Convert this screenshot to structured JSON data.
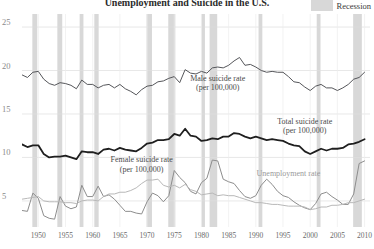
{
  "chart_data": {
    "type": "line",
    "title": "Unemployment and Suicide in the U.S.",
    "xlabel": "",
    "ylabel": "",
    "xlim": [
      1947,
      2011
    ],
    "ylim": [
      2.0,
      26.5
    ],
    "grid": true,
    "x_ticks": [
      "1950",
      "1955",
      "1960",
      "1965",
      "1970",
      "1975",
      "1980",
      "1985",
      "1990",
      "1995",
      "2000",
      "2005",
      "2010"
    ],
    "x_tick_values": [
      1950,
      1955,
      1960,
      1965,
      1970,
      1975,
      1980,
      1985,
      1990,
      1995,
      2000,
      2005,
      2010
    ],
    "y_ticks": [
      "25",
      "20",
      "15",
      "10",
      "5"
    ],
    "y_tick_values": [
      25,
      20,
      15,
      10,
      5
    ],
    "legend_position": "top-right",
    "legend": [
      {
        "label": "Recession",
        "color": "#d8d8d8",
        "kind": "band"
      }
    ],
    "recessions": [
      {
        "start": 1948.9,
        "end": 1949.8
      },
      {
        "start": 1953.5,
        "end": 1954.4
      },
      {
        "start": 1957.6,
        "end": 1958.3
      },
      {
        "start": 1960.3,
        "end": 1961.1
      },
      {
        "start": 1969.9,
        "end": 1970.9
      },
      {
        "start": 1973.9,
        "end": 1975.2
      },
      {
        "start": 1980.0,
        "end": 1980.5
      },
      {
        "start": 1981.5,
        "end": 1982.9
      },
      {
        "start": 1990.5,
        "end": 1991.2
      },
      {
        "start": 2001.2,
        "end": 2001.9
      },
      {
        "start": 2007.9,
        "end": 2009.5
      }
    ],
    "x": [
      1947,
      1948,
      1949,
      1950,
      1951,
      1952,
      1953,
      1954,
      1955,
      1956,
      1957,
      1958,
      1959,
      1960,
      1961,
      1962,
      1963,
      1964,
      1965,
      1966,
      1967,
      1968,
      1969,
      1970,
      1971,
      1972,
      1973,
      1974,
      1975,
      1976,
      1977,
      1978,
      1979,
      1980,
      1981,
      1982,
      1983,
      1984,
      1985,
      1986,
      1987,
      1988,
      1989,
      1990,
      1991,
      1992,
      1993,
      1994,
      1995,
      1996,
      1997,
      1998,
      1999,
      2000,
      2001,
      2002,
      2003,
      2004,
      2005,
      2006,
      2007,
      2008,
      2009,
      2010
    ],
    "series": [
      {
        "name": "Male suicide rate (per 100,000)",
        "color": "#55565a",
        "width": 1.0,
        "label_x": 1983,
        "label_y": 18.6,
        "values": [
          19.5,
          19.2,
          19.8,
          19.9,
          19.0,
          18.5,
          18.3,
          18.6,
          18.5,
          18.3,
          17.9,
          18.9,
          18.4,
          18.4,
          18.0,
          18.3,
          18.4,
          18.0,
          18.4,
          17.9,
          17.6,
          17.2,
          17.8,
          18.2,
          18.3,
          18.7,
          18.8,
          19.1,
          19.3,
          18.6,
          20.1,
          19.7,
          19.6,
          19.9,
          19.7,
          20.3,
          20.4,
          20.3,
          20.6,
          21.1,
          21.5,
          20.6,
          20.7,
          20.4,
          20.0,
          19.8,
          19.9,
          19.8,
          19.8,
          19.3,
          18.7,
          18.6,
          18.1,
          17.7,
          18.2,
          18.4,
          18.0,
          18.0,
          17.7,
          18.0,
          18.4,
          19.0,
          19.2,
          19.8
        ]
      },
      {
        "name": "Total suicide rate (per 100,000)",
        "color": "#1f1f1f",
        "width": 1.8,
        "label_x": 1999,
        "label_y": 13.6,
        "values": [
          11.5,
          11.2,
          11.4,
          11.4,
          10.4,
          10.0,
          10.1,
          10.1,
          10.2,
          10.0,
          9.8,
          10.7,
          10.6,
          10.6,
          10.4,
          10.9,
          11.0,
          10.8,
          11.1,
          10.9,
          10.8,
          10.7,
          11.1,
          11.6,
          11.7,
          12.0,
          12.0,
          12.1,
          12.7,
          12.5,
          13.3,
          12.5,
          12.4,
          11.9,
          12.0,
          12.2,
          12.1,
          12.4,
          12.4,
          12.8,
          12.7,
          12.4,
          12.2,
          12.4,
          12.2,
          12.0,
          12.1,
          12.0,
          11.9,
          11.6,
          11.4,
          11.3,
          10.7,
          10.4,
          10.7,
          11.0,
          10.8,
          11.0,
          11.0,
          11.1,
          11.5,
          11.6,
          11.8,
          12.1
        ]
      },
      {
        "name": "Unemployment rate",
        "color": "#8d8d8d",
        "width": 1.0,
        "label_x": 1996,
        "label_y": 8.1,
        "values": [
          3.9,
          3.8,
          5.9,
          5.3,
          3.3,
          3.0,
          2.9,
          5.5,
          4.4,
          4.1,
          4.3,
          6.8,
          5.5,
          5.5,
          6.7,
          5.5,
          5.7,
          5.2,
          4.5,
          3.8,
          3.8,
          3.6,
          3.5,
          4.9,
          5.9,
          5.6,
          4.9,
          5.6,
          8.5,
          7.7,
          7.1,
          6.1,
          5.8,
          7.1,
          7.6,
          9.7,
          9.6,
          7.5,
          7.2,
          7.0,
          6.2,
          5.5,
          5.3,
          5.6,
          6.8,
          7.5,
          6.9,
          6.1,
          5.6,
          5.4,
          4.9,
          4.5,
          4.2,
          4.0,
          4.7,
          5.8,
          6.0,
          5.5,
          5.1,
          4.6,
          4.6,
          5.8,
          9.3,
          9.6
        ]
      },
      {
        "name": "Female suicide rate (per 100,000)",
        "color": "#b8b8b8",
        "width": 1.0,
        "label_x": 1969,
        "label_y": 9.2,
        "values": [
          5.2,
          5.3,
          5.4,
          5.5,
          5.0,
          4.9,
          4.9,
          4.9,
          4.8,
          4.8,
          4.7,
          5.0,
          5.1,
          5.1,
          5.0,
          5.5,
          5.8,
          5.8,
          6.0,
          6.0,
          6.2,
          6.5,
          7.0,
          7.4,
          7.4,
          7.5,
          6.8,
          6.6,
          6.8,
          6.5,
          6.9,
          6.3,
          6.1,
          5.7,
          5.8,
          5.9,
          5.6,
          5.7,
          5.6,
          5.6,
          5.4,
          5.2,
          5.0,
          4.8,
          4.8,
          4.7,
          4.6,
          4.6,
          4.5,
          4.4,
          4.4,
          4.4,
          4.3,
          4.0,
          4.1,
          4.3,
          4.3,
          4.5,
          4.5,
          4.6,
          4.8,
          4.8,
          5.0,
          5.2
        ]
      }
    ]
  }
}
